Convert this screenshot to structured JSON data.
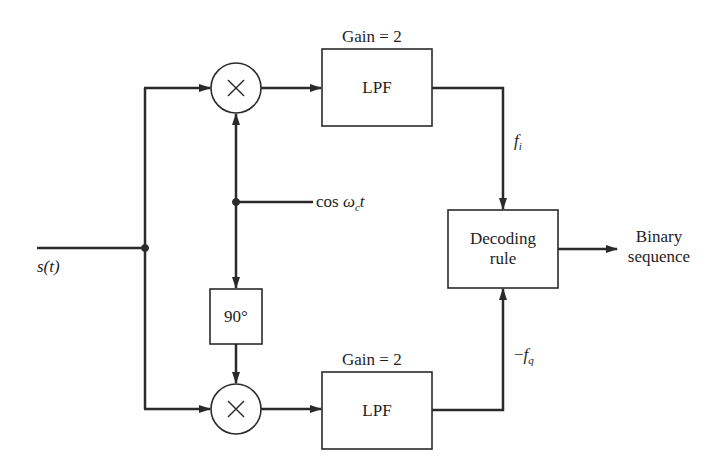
{
  "diagram": {
    "type": "block-diagram",
    "input": {
      "label": "s(t)"
    },
    "carrier": {
      "label_prefix": "cos ",
      "label_omega": "ω",
      "label_sub": "c",
      "label_suffix": "t"
    },
    "phase_shifter": {
      "label": "90°"
    },
    "multipliers": [
      {
        "id": "mixer-top",
        "symbol": "×"
      },
      {
        "id": "mixer-bottom",
        "symbol": "×"
      }
    ],
    "filters": [
      {
        "id": "lpf-top",
        "label": "LPF",
        "gain_label": "Gain = 2"
      },
      {
        "id": "lpf-bottom",
        "label": "LPF",
        "gain_label": "Gain = 2"
      }
    ],
    "branch_signals": {
      "in_phase": {
        "base": "f",
        "sub": "i"
      },
      "quadrature": {
        "prefix": "−",
        "base": "f",
        "sub": "q"
      }
    },
    "decoder": {
      "line1": "Decoding",
      "line2": "rule"
    },
    "output": {
      "line1": "Binary",
      "line2": "sequence"
    },
    "colors": {
      "stroke": "#2a2a2a",
      "background": "#ffffff"
    }
  }
}
